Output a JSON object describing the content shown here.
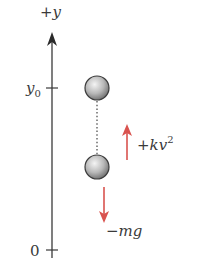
{
  "axis": {
    "label_plus": "+",
    "label_var": "y",
    "y0_base": "y",
    "y0_sub": "0",
    "zero_label": "0"
  },
  "forces": {
    "drag_sign": "+",
    "drag_expr": "kv",
    "drag_exp": "2",
    "gravity_sign": "−",
    "gravity_expr": "mg"
  },
  "colors": {
    "axis": "#3a3a3a",
    "force_arrow": "#d9534f",
    "ball_light": "#f2f2f2",
    "ball_dark": "#6e6e6e",
    "ball_outline": "#3c3c3c"
  }
}
